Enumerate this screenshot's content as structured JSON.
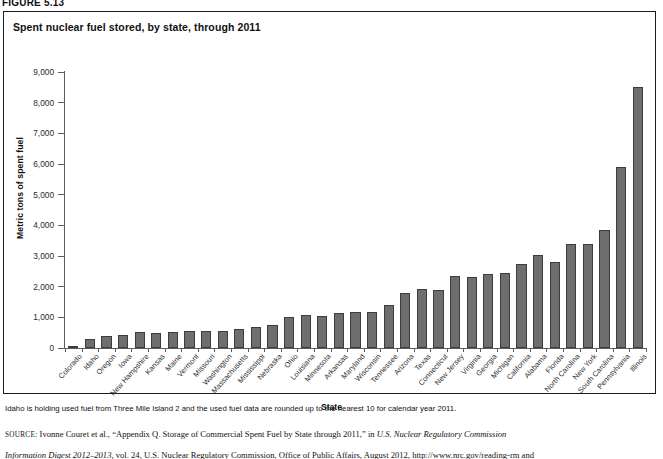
{
  "figure": {
    "label": "FIGURE 5.13",
    "title": "Spent nuclear fuel stored, by state, through 2011",
    "footnote": "Idaho is holding used fuel from Three Mile Island 2 and the used fuel data are rounded up to the nearest 10 for calendar year 2011.",
    "source_prefix": "SOURCE:",
    "source_text_1": " Ivonne Couret et al., “Appendix Q. Storage of Commercial Spent Fuel by State through 2011,” in ",
    "source_italic_1": "U.S. Nuclear Regulatory Commission",
    "source_italic_2": "Information Digest 2012–2013,",
    "source_text_2": " vol. 24, U.S. Nuclear Regulatory Commission, Office of Public Affairs, August 2012, http://www.nrc.gov/reading-rm and"
  },
  "chart_data": {
    "type": "bar",
    "title": "Spent nuclear fuel stored, by state, through 2011",
    "xlabel": "State",
    "ylabel": "Metric tons of spent fuel",
    "ylim": [
      0,
      9000
    ],
    "ytick_labels": [
      "9,000",
      "8,000",
      "7,000",
      "6,000",
      "5,000",
      "4,000",
      "3,000",
      "2,000",
      "1,000",
      "0"
    ],
    "ytick_values": [
      9000,
      8000,
      7000,
      6000,
      5000,
      4000,
      3000,
      2000,
      1000,
      0
    ],
    "grid": false,
    "legend": "none",
    "bar_color": "#6e6e6e",
    "categories": [
      "Colorado",
      "Idaho",
      "Oregon",
      "Iowa",
      "New Hampshire",
      "Kansas",
      "Maine",
      "Vermont",
      "Missouri",
      "Washington",
      "Massachusetts",
      "Mississippi",
      "Nebraska",
      "Ohio",
      "Louisiana",
      "Minnesota",
      "Arkansas",
      "Maryland",
      "Wisconsin",
      "Tennessee",
      "Arizona",
      "Texas",
      "Connecticut",
      "New Jersey",
      "Virginia",
      "Georgia",
      "Michigan",
      "California",
      "Alabama",
      "Florida",
      "North Carolina",
      "New York",
      "South Carolina",
      "Pennsylvania",
      "Illinois"
    ],
    "values": [
      30,
      300,
      400,
      440,
      510,
      490,
      520,
      550,
      570,
      540,
      620,
      680,
      740,
      1000,
      1090,
      1060,
      1150,
      1190,
      1170,
      1390,
      1790,
      1940,
      1880,
      2350,
      2310,
      2420,
      2430,
      2750,
      3030,
      2790,
      3400,
      3400,
      3850,
      5890,
      8500
    ]
  }
}
